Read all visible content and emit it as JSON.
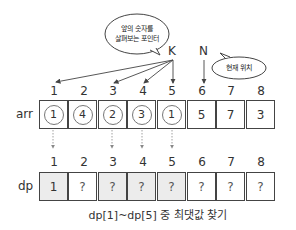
{
  "pointers": {
    "k_label": "K",
    "n_label": "N"
  },
  "bubbles": {
    "k_bubble": {
      "line1": "앞의 숫자를",
      "line2": "살펴보는 포인터"
    },
    "n_bubble": {
      "text": "현재 위치"
    }
  },
  "arr": {
    "label": "arr",
    "indices": [
      "1",
      "2",
      "3",
      "4",
      "5",
      "6",
      "7",
      "8"
    ],
    "values": [
      "1",
      "4",
      "2",
      "3",
      "1",
      "5",
      "7",
      "3"
    ],
    "circled": [
      true,
      true,
      true,
      true,
      true,
      false,
      false,
      false
    ]
  },
  "dp": {
    "label": "dp",
    "indices": [
      "1",
      "2",
      "3",
      "4",
      "5",
      "6",
      "7",
      "8"
    ],
    "values": [
      "1",
      "?",
      "?",
      "?",
      "?",
      "?",
      "?",
      "?"
    ],
    "shaded": [
      true,
      false,
      true,
      true,
      true,
      false,
      false,
      false
    ]
  },
  "caption": "dp[1]~dp[5] 중 최댓값 찾기"
}
